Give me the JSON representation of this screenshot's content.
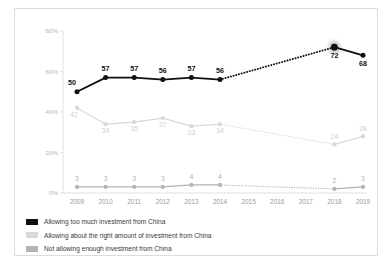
{
  "chart_data": {
    "type": "line",
    "title": "",
    "subtitle": "",
    "xlabel": "",
    "ylabel": "",
    "x": [
      "2009",
      "2010",
      "2011",
      "2012",
      "2013",
      "2014",
      "2015",
      "2016",
      "2017",
      "2018",
      "2019"
    ],
    "categories": [
      "2009",
      "2010",
      "2011",
      "2012",
      "2013",
      "2014",
      "2015",
      "2016",
      "2017",
      "2018",
      "2019"
    ],
    "ylim": [
      0,
      80
    ],
    "yticks": [
      0,
      20,
      40,
      60,
      80
    ],
    "ytick_labels": [
      "0%",
      "20%",
      "40%",
      "60%",
      "80%"
    ],
    "grid": false,
    "legend_position": "bottom-left",
    "gap_years": [
      "2015",
      "2016",
      "2017"
    ],
    "highlight_point": {
      "series": "Allowing too much investment from China",
      "x": "2018",
      "value": 72
    },
    "series": [
      {
        "name": "Allowing too much investment from China",
        "color": "#111111",
        "label_color": "#111111",
        "values": [
          50,
          57,
          57,
          56,
          57,
          56,
          null,
          null,
          null,
          72,
          68
        ],
        "labels": [
          "50",
          "57",
          "57",
          "56",
          "57",
          "56",
          "",
          "",
          "",
          "72",
          "68"
        ]
      },
      {
        "name": "Allowing about the right amount of investment from China",
        "color": "#d8d8d8",
        "label_color": "#cfcfcf",
        "values": [
          42,
          34,
          35,
          37,
          33,
          34,
          null,
          null,
          null,
          24,
          28
        ],
        "labels": [
          "42",
          "34",
          "35",
          "37",
          "33",
          "34",
          "",
          "",
          "",
          "24",
          "28"
        ]
      },
      {
        "name": "Not allowing enough investment from China",
        "color": "#b4b4b4",
        "label_color": "#b0b0b0",
        "values": [
          3,
          3,
          3,
          3,
          4,
          4,
          null,
          null,
          null,
          2,
          3
        ],
        "labels": [
          "3",
          "3",
          "3",
          "3",
          "4",
          "4",
          "",
          "",
          "",
          "2",
          "3"
        ]
      }
    ]
  },
  "legend": {
    "items": [
      {
        "label": "Allowing too much investment from China",
        "color": "#111111",
        "swatch": "legend-swatch-black"
      },
      {
        "label": "Allowing about the right amount of investment from China",
        "color": "#d8d8d8",
        "swatch": "legend-swatch-lightgray"
      },
      {
        "label": "Not allowing enough investment from China",
        "color": "#b4b4b4",
        "swatch": "legend-swatch-gray"
      }
    ]
  },
  "axis": {
    "y_labels": [
      "80%",
      "60%",
      "40%",
      "20%",
      "0%"
    ],
    "x_labels": [
      "2009",
      "2010",
      "2011",
      "2012",
      "2013",
      "2014",
      "2015",
      "2016",
      "2017",
      "2018",
      "2019"
    ]
  }
}
